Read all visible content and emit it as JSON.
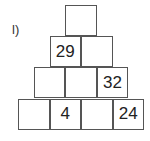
{
  "label": "l)",
  "pyramid": {
    "rows": [
      [
        ""
      ],
      [
        "29",
        ""
      ],
      [
        "",
        "",
        "32"
      ],
      [
        "",
        "4",
        "",
        "24"
      ]
    ]
  }
}
